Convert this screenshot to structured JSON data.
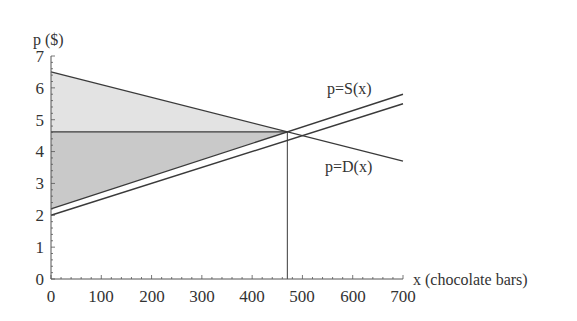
{
  "chart_data": {
    "type": "line",
    "title": "",
    "xlabel": "x (chocolate bars)",
    "ylabel": "p ($)",
    "xlim": [
      0,
      700
    ],
    "ylim": [
      0,
      7
    ],
    "x_ticks": [
      0,
      100,
      200,
      300,
      400,
      500,
      600,
      700
    ],
    "y_ticks": [
      0,
      1,
      2,
      3,
      4,
      5,
      6,
      7
    ],
    "grid": false,
    "series": [
      {
        "name": "p=D(x)",
        "role": "demand",
        "x": [
          0,
          700
        ],
        "y": [
          6.5,
          3.7
        ]
      },
      {
        "name": "p=S(x)",
        "role": "supply (upper)",
        "x": [
          0,
          700
        ],
        "y": [
          2.2,
          5.8
        ]
      },
      {
        "name": "supply (shifted)",
        "role": "supply (lower)",
        "x": [
          0,
          700
        ],
        "y": [
          2.0,
          5.5
        ]
      }
    ],
    "equilibrium": {
      "x": 470,
      "p": 4.62
    },
    "shaded_regions": [
      {
        "name": "consumer surplus",
        "color": "#e3e3e3",
        "vertices": [
          [
            0,
            6.5
          ],
          [
            470,
            4.62
          ],
          [
            0,
            4.62
          ]
        ]
      },
      {
        "name": "producer surplus",
        "color": "#c9c9c9",
        "vertices": [
          [
            0,
            4.62
          ],
          [
            470,
            4.62
          ],
          [
            0,
            2.2
          ]
        ]
      }
    ],
    "annotations": [
      {
        "text": "p=S(x)",
        "near": [
          550,
          5.5
        ]
      },
      {
        "text": "p=D(x)",
        "near": [
          550,
          3.4
        ]
      }
    ]
  },
  "labels": {
    "ylabel": "p ($)",
    "xlabel": "x (chocolate bars)",
    "supply": "p=S(x)",
    "demand": "p=D(x)",
    "xticks": [
      "0",
      "100",
      "200",
      "300",
      "400",
      "500",
      "600",
      "700"
    ],
    "yticks": [
      "0",
      "1",
      "2",
      "3",
      "4",
      "5",
      "6",
      "7"
    ]
  },
  "colors": {
    "line": "#3a3a3a",
    "axis": "#555555",
    "cs_fill": "#e3e3e3",
    "ps_fill": "#c9c9c9"
  }
}
